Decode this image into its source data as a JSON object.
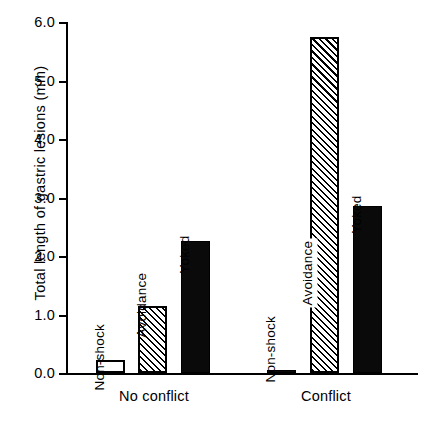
{
  "chart_data": {
    "type": "bar",
    "title": "",
    "xlabel": "",
    "ylabel": "Total length of gastric lesions (mm)",
    "ylim": [
      0.0,
      6.0
    ],
    "yticks": [
      "0.0",
      "1.0",
      "2.0",
      "3.0",
      "4.0",
      "5.0",
      "6.0"
    ],
    "ytick_values": [
      0.0,
      1.0,
      2.0,
      3.0,
      4.0,
      5.0,
      6.0
    ],
    "grid": false,
    "legend": "none (bars labelled in place)",
    "categories": [
      "No conflict",
      "Conflict"
    ],
    "series": [
      {
        "name": "Non-shock",
        "style": "open",
        "values": [
          0.22,
          0.03
        ]
      },
      {
        "name": "Avoidance",
        "style": "hatched",
        "values": [
          1.15,
          5.75
        ]
      },
      {
        "name": "Yoked",
        "style": "solid-black",
        "values": [
          2.25,
          2.85
        ]
      }
    ],
    "bars": [
      {
        "group": "No conflict",
        "label": "Non-shock",
        "value": 0.22,
        "style": "open"
      },
      {
        "group": "No conflict",
        "label": "Avoidance",
        "value": 1.15,
        "style": "hatched"
      },
      {
        "group": "No conflict",
        "label": "Yoked",
        "value": 2.25,
        "style": "solid"
      },
      {
        "group": "Conflict",
        "label": "Non-shock",
        "value": 0.03,
        "style": "solid"
      },
      {
        "group": "Conflict",
        "label": "Avoidance",
        "value": 5.75,
        "style": "hatched"
      },
      {
        "group": "Conflict",
        "label": "Yoked",
        "value": 2.85,
        "style": "solid"
      }
    ],
    "colors": {
      "axis": "#000000",
      "solid_bar": "#0a0a0a",
      "open_bar_fill": "#ffffff",
      "hatch_line": "#000000",
      "background": "#ffffff"
    }
  },
  "axis": {
    "y_title": "Total length of gastric lesions (mm)",
    "ticks": [
      "6.0",
      "5.0",
      "4.0",
      "3.0",
      "2.0",
      "1.0",
      "0.0"
    ]
  },
  "groups": {
    "g1": "No conflict",
    "g2": "Conflict"
  },
  "bar_labels": {
    "g1b1": "Non-shock",
    "g1b2": "Avoidance",
    "g1b3": "Yoked",
    "g2b1": "Non-shock",
    "g2b2": "Avoidance",
    "g2b3": "Yoked"
  }
}
